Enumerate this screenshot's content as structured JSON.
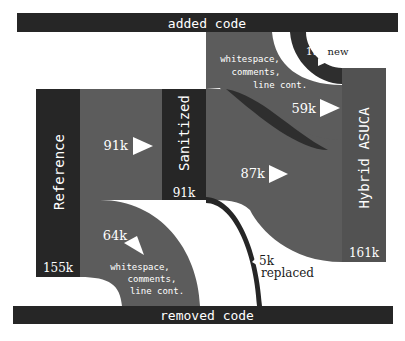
{
  "diagram": {
    "type": "sankey",
    "colors": {
      "node": "#262626",
      "flow": "#5c5c5c",
      "flow_dark": "#2e2e2e",
      "label_light": "#ffffff",
      "label_dark": "#1a1a1a",
      "background": "#ffffff"
    },
    "bars": {
      "added": "added code",
      "removed": "removed code"
    },
    "nodes": {
      "reference": {
        "label": "Reference",
        "value": "155k"
      },
      "sanitized": {
        "label": "Sanitized",
        "value": "91k"
      },
      "hybrid": {
        "label": "Hybrid ASUCA",
        "value": "161k"
      }
    },
    "flows": {
      "ref_to_sanitized": {
        "value": "91k"
      },
      "ref_to_removed": {
        "value": "64k",
        "line1": "whitespace,",
        "line2": "comments,",
        "line3": "line cont."
      },
      "sanitized_to_hybrid": {
        "value": "87k"
      },
      "sanitized_to_removed": {
        "value": "5k",
        "note": "replaced"
      },
      "added_to_hybrid_ws": {
        "value": "59k",
        "line1": "whitespace,",
        "line2": "comments,",
        "line3": "line cont."
      },
      "added_to_hybrid_new": {
        "value": "15k",
        "note": "new"
      }
    }
  }
}
